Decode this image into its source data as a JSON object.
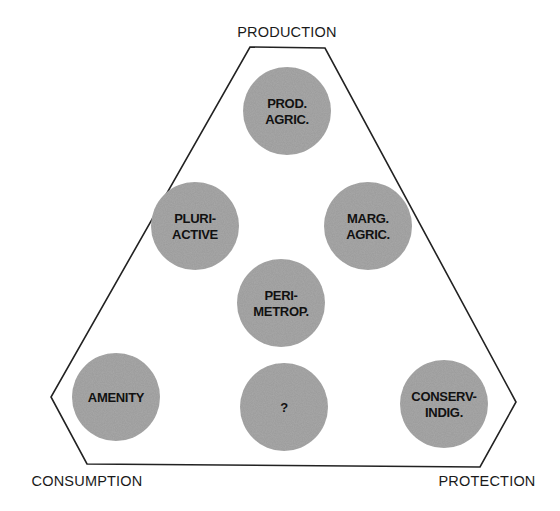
{
  "diagram": {
    "type": "triangular-typology",
    "corners": {
      "top": "PRODUCTION",
      "bottom_left": "CONSUMPTION",
      "bottom_right": "PROTECTION"
    },
    "nodes": [
      {
        "id": "prod-agric",
        "lines": [
          "PROD.",
          "AGRIC."
        ]
      },
      {
        "id": "pluri-active",
        "lines": [
          "PLURI-",
          "ACTIVE"
        ]
      },
      {
        "id": "marg-agric",
        "lines": [
          "MARG.",
          "AGRIC."
        ]
      },
      {
        "id": "perimetrop",
        "lines": [
          "PERI-",
          "METROP."
        ]
      },
      {
        "id": "amenity",
        "lines": [
          "AMENITY"
        ]
      },
      {
        "id": "unknown",
        "lines": [
          "?"
        ]
      },
      {
        "id": "conserv-indig",
        "lines": [
          "CONSERV-",
          "INDIG."
        ]
      }
    ],
    "colors": {
      "node_fill": "#a9a9a9",
      "outline": "#222222",
      "text": "#111111"
    }
  }
}
